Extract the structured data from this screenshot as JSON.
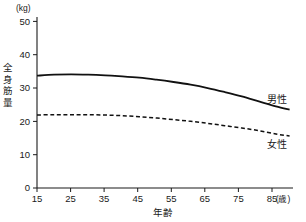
{
  "chart_data": {
    "type": "line",
    "title": "",
    "xlabel": "年齢",
    "ylabel": "全身筋量",
    "x_unit": "(歳)",
    "y_unit": "(kg)",
    "xlim": [
      15,
      90
    ],
    "ylim": [
      0,
      53
    ],
    "x_ticks": [
      15,
      25,
      35,
      45,
      55,
      65,
      75,
      85
    ],
    "y_ticks": [
      0,
      10,
      20,
      30,
      40,
      50
    ],
    "grid": false,
    "legend_position": "inline-right",
    "x": [
      15,
      20,
      25,
      30,
      35,
      40,
      45,
      50,
      55,
      60,
      65,
      70,
      75,
      80,
      85,
      89
    ],
    "series": [
      {
        "name": "男性",
        "style": "solid",
        "values": [
          33.7,
          34.0,
          34.1,
          34.0,
          33.8,
          33.5,
          33.1,
          32.5,
          31.8,
          31.0,
          30.0,
          28.8,
          27.5,
          26.0,
          24.5,
          23.5
        ]
      },
      {
        "name": "女性",
        "style": "dashed",
        "values": [
          21.9,
          22.0,
          22.0,
          22.0,
          21.9,
          21.7,
          21.4,
          21.0,
          20.5,
          20.0,
          19.4,
          18.7,
          18.0,
          17.2,
          16.2,
          15.6
        ]
      }
    ]
  },
  "axes": {
    "y_unit_label": "(kg)",
    "y_tick_labels": [
      "50",
      "40",
      "30",
      "20",
      "10",
      "0"
    ],
    "y_title_chars": [
      "全",
      "身",
      "筋",
      "量"
    ],
    "x_tick_labels": [
      "15",
      "25",
      "35",
      "45",
      "55",
      "65",
      "75",
      "85"
    ],
    "x_unit_label": "(歳)",
    "x_title": "年齢"
  },
  "legend": {
    "male_label": "男性",
    "female_label": "女性"
  },
  "colors": {
    "axis": "#1a1a1a",
    "male_line": "#111111",
    "female_line": "#111111",
    "background": "#ffffff"
  }
}
